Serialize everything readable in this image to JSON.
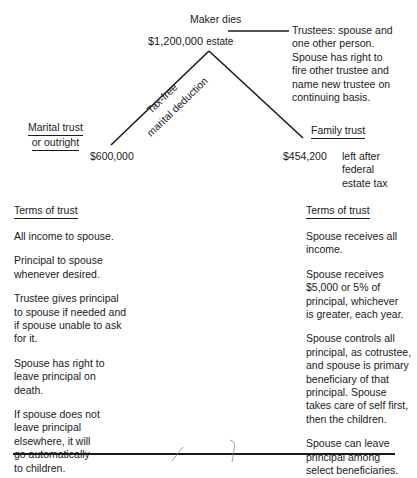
{
  "diagram": {
    "top": {
      "event": "Maker dies",
      "estate_amount": "$1,200,000",
      "estate_label": "estate"
    },
    "trustees_note": "Trustees: spouse and\none other person.\nSpouse has right to\nfire other trustee and\nname new trustee on\ncontinuing basis.",
    "left_branch": {
      "label_line1": "Tax-free",
      "label_line2": "marital deduction",
      "amount": "$600,000",
      "trust_name_line1": "Marital trust",
      "trust_name_line2": "or outright"
    },
    "right_branch": {
      "amount": "$454,200",
      "amount_note": "left after\nfederal\nestate tax",
      "trust_name": "Family trust"
    },
    "left_terms": {
      "heading": "Terms of trust",
      "items": [
        "All income to spouse.",
        "Principal to spouse\nwhenever desired.",
        "Trustee gives principal\nto spouse if needed and\nif spouse unable to ask\nfor it.",
        "Spouse has right to\nleave principal on\ndeath.",
        "If spouse does not\nleave principal\nelsewhere, it will\ngo automatically\nto children."
      ]
    },
    "right_terms": {
      "heading": "Terms of trust",
      "items": [
        "Spouse receives all\nincome.",
        "Spouse receives\n$5,000 or 5% of\nprincipal, whichever\nis greater, each year.",
        "Spouse controls all\nprincipal, as cotrustee,\nand spouse is primary\nbeneficiary of that\nprincipal. Spouse\ntakes care of self first,\nthen the children.",
        "Spouse can leave\nprincipal among\nselect beneficiaries."
      ]
    },
    "colors": {
      "ink": "#1a1a1a",
      "background": "#ffffff",
      "pencil": "#777777"
    }
  }
}
